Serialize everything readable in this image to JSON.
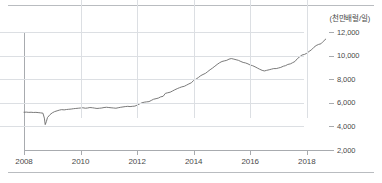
{
  "figure": {
    "unit_label": "(천만배럴/일)",
    "colors": {
      "line": "#6b6b6b",
      "grid": "#dcdfe3",
      "axis": "#a8abaf",
      "rule": "#b9bcc0",
      "text": "#4a4a4a"
    },
    "rules": {
      "top": "horizontal-rule",
      "bottom": "horizontal-rule"
    }
  },
  "chart_data": {
    "type": "line",
    "title": "",
    "subtitle": "",
    "xlabel": "",
    "ylabel": "(천만배럴/일)",
    "unit": "천만배럴/일",
    "grid": true,
    "legend": false,
    "legend_position": "none",
    "xlim": [
      2008.0,
      2018.75
    ],
    "ylim": [
      2000,
      12000
    ],
    "ytick_labels": [
      "12,000",
      "10,000",
      "8,000",
      "6,000",
      "4,000",
      "2,000"
    ],
    "yticks": [
      12000,
      10000,
      8000,
      6000,
      4000,
      2000
    ],
    "xtick_labels": [
      "2008",
      "2010",
      "2012",
      "2014",
      "2016",
      "2018"
    ],
    "xticks": [
      2008,
      2010,
      2012,
      2014,
      2016,
      2018
    ],
    "series": [
      {
        "name": "원유생산량",
        "x": [
          2008.0,
          2008.08,
          2008.17,
          2008.25,
          2008.33,
          2008.42,
          2008.5,
          2008.58,
          2008.67,
          2008.72,
          2008.75,
          2008.79,
          2008.83,
          2008.92,
          2009.0,
          2009.08,
          2009.17,
          2009.25,
          2009.33,
          2009.42,
          2009.5,
          2009.58,
          2009.67,
          2009.75,
          2009.83,
          2009.92,
          2010.0,
          2010.08,
          2010.17,
          2010.25,
          2010.33,
          2010.42,
          2010.5,
          2010.58,
          2010.67,
          2010.75,
          2010.83,
          2010.92,
          2011.0,
          2011.08,
          2011.17,
          2011.25,
          2011.33,
          2011.42,
          2011.5,
          2011.58,
          2011.67,
          2011.75,
          2011.83,
          2011.92,
          2012.0,
          2012.08,
          2012.17,
          2012.25,
          2012.33,
          2012.42,
          2012.5,
          2012.58,
          2012.67,
          2012.75,
          2012.83,
          2012.92,
          2013.0,
          2013.08,
          2013.17,
          2013.25,
          2013.33,
          2013.42,
          2013.5,
          2013.58,
          2013.67,
          2013.75,
          2013.83,
          2013.92,
          2014.0,
          2014.08,
          2014.17,
          2014.25,
          2014.33,
          2014.42,
          2014.5,
          2014.58,
          2014.67,
          2014.75,
          2014.83,
          2014.92,
          2015.0,
          2015.08,
          2015.17,
          2015.25,
          2015.33,
          2015.42,
          2015.5,
          2015.58,
          2015.67,
          2015.75,
          2015.83,
          2015.92,
          2016.0,
          2016.08,
          2016.17,
          2016.25,
          2016.33,
          2016.42,
          2016.5,
          2016.58,
          2016.67,
          2016.75,
          2016.83,
          2016.92,
          2017.0,
          2017.08,
          2017.17,
          2017.25,
          2017.33,
          2017.42,
          2017.5,
          2017.58,
          2017.67,
          2017.75,
          2017.83,
          2017.92,
          2018.0,
          2018.08,
          2018.17,
          2018.25,
          2018.33,
          2018.42,
          2018.5,
          2018.58,
          2018.67
        ],
        "values": [
          5200,
          5210,
          5190,
          5200,
          5180,
          5190,
          5170,
          5150,
          5120,
          4700,
          4150,
          4400,
          4750,
          5000,
          5150,
          5250,
          5320,
          5380,
          5420,
          5400,
          5430,
          5450,
          5470,
          5500,
          5520,
          5540,
          5560,
          5580,
          5540,
          5560,
          5600,
          5580,
          5550,
          5520,
          5540,
          5560,
          5600,
          5620,
          5600,
          5580,
          5560,
          5540,
          5580,
          5620,
          5650,
          5680,
          5700,
          5680,
          5700,
          5720,
          5800,
          5900,
          6000,
          6050,
          6080,
          6100,
          6200,
          6300,
          6350,
          6400,
          6500,
          6550,
          6800,
          6850,
          6900,
          7000,
          7100,
          7200,
          7280,
          7350,
          7400,
          7500,
          7600,
          7700,
          7900,
          8000,
          8150,
          8300,
          8400,
          8500,
          8650,
          8800,
          8950,
          9100,
          9250,
          9400,
          9500,
          9550,
          9600,
          9700,
          9750,
          9700,
          9650,
          9600,
          9500,
          9420,
          9380,
          9300,
          9200,
          9150,
          9050,
          8950,
          8850,
          8750,
          8700,
          8750,
          8800,
          8850,
          8900,
          8900,
          8950,
          9000,
          9100,
          9150,
          9250,
          9300,
          9400,
          9500,
          9750,
          9900,
          10050,
          10100,
          10200,
          10350,
          10500,
          10700,
          10850,
          10950,
          11000,
          11200,
          11400
        ]
      }
    ]
  }
}
